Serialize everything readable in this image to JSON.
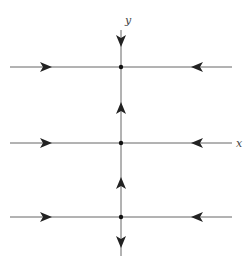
{
  "diagram": {
    "type": "phase-portrait",
    "axes": {
      "x_label": "x",
      "y_label": "y"
    },
    "colors": {
      "line": "#666666",
      "arrow": "#222222",
      "point": "#111111"
    },
    "vertical_axis_x": 121,
    "horizontal_lines": [
      {
        "y": 67,
        "role": "trajectory-top"
      },
      {
        "y": 143,
        "role": "x-axis"
      },
      {
        "y": 217,
        "role": "trajectory-bottom"
      }
    ],
    "equilibrium_points": [
      {
        "x": 121,
        "y": 67
      },
      {
        "x": 121,
        "y": 143
      },
      {
        "x": 121,
        "y": 217
      }
    ],
    "horizontal_arrows": [
      {
        "x": 45,
        "direction": "right"
      },
      {
        "x": 197,
        "direction": "left"
      }
    ],
    "vertical_arrows": [
      {
        "y": 40,
        "direction": "down"
      },
      {
        "y": 108,
        "direction": "up"
      },
      {
        "y": 183,
        "direction": "up"
      },
      {
        "y": 241,
        "direction": "down"
      }
    ]
  }
}
